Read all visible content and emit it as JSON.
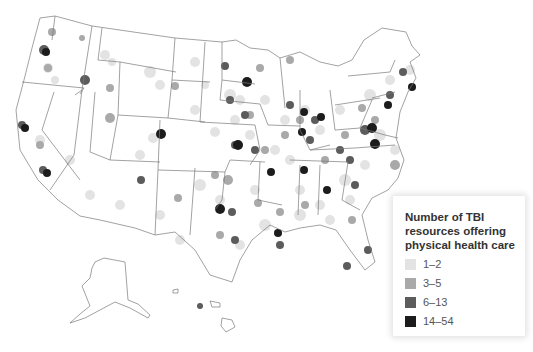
{
  "map": {
    "subject": "TBI resources offering physical health care, United States",
    "regions_shown": [
      "Contiguous United States",
      "Alaska",
      "Hawaii"
    ],
    "border_color": "#7a7a7a"
  },
  "legend": {
    "title": "Number of TBI resources offering physical health care",
    "title_lines": [
      "Number of TBI",
      "resources offering",
      "physical health care"
    ],
    "bins": [
      {
        "label": "1–2",
        "color": "#e3e3e3"
      },
      {
        "label": "3–5",
        "color": "#a9a9a9"
      },
      {
        "label": "6–13",
        "color": "#5c5c5c"
      },
      {
        "label": "14–54",
        "color": "#1c1c1c"
      }
    ]
  }
}
